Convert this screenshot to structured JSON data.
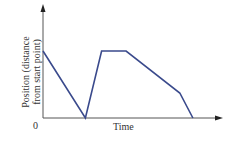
{
  "chart_data": {
    "type": "line",
    "title": "",
    "xlabel": "Time",
    "ylabel": "Position (distance from start point)",
    "origin_label": "0",
    "x_ticks": [],
    "y_ticks": [],
    "grid": false,
    "legend": null,
    "series": [
      {
        "name": "position",
        "color": "#3a4a8c",
        "points": [
          {
            "x": 0,
            "y": 0.67
          },
          {
            "x": 0.26,
            "y": 0.0
          },
          {
            "x": 0.36,
            "y": 0.67
          },
          {
            "x": 0.51,
            "y": 0.67
          },
          {
            "x": 0.84,
            "y": 0.25
          },
          {
            "x": 0.92,
            "y": 0.0
          }
        ]
      }
    ],
    "xlim": [
      0,
      1
    ],
    "ylim": [
      0,
      1
    ]
  },
  "labels": {
    "x_axis": "Time",
    "y_axis_line1": "Position (distance",
    "y_axis_line2": "from start point)",
    "origin": "0"
  }
}
